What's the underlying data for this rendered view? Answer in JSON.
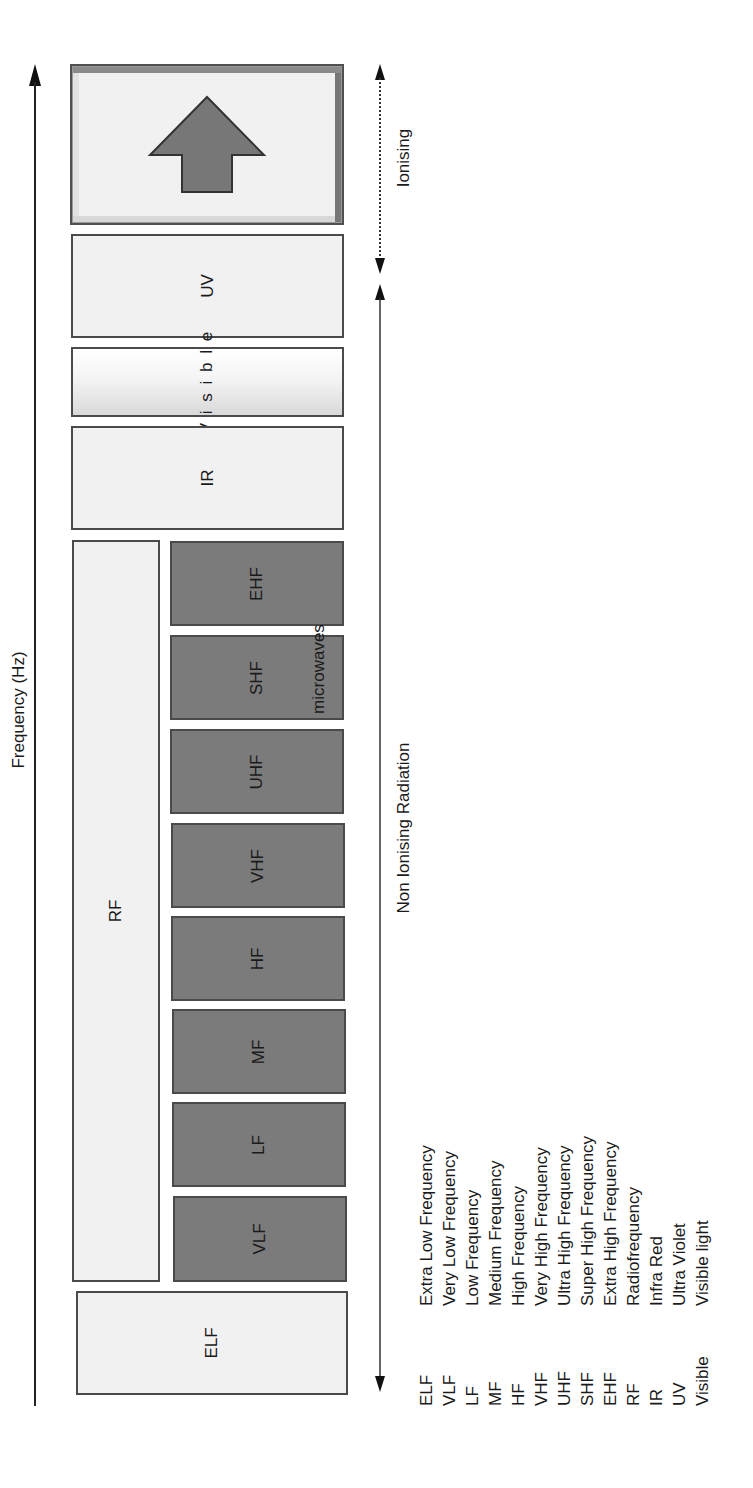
{
  "axis": {
    "frequency_label": "Frequency (Hz)"
  },
  "regions": {
    "ionising_label": "Ionising",
    "non_ionising_label": "Non Ionising Radiation"
  },
  "bands": {
    "ionising_icon": "up-arrow-icon",
    "uv": "UV",
    "visible": "V i s i b l e",
    "ir": "IR",
    "rf": "RF",
    "microwaves": "microwaves",
    "ehf": "EHF",
    "shf": "SHF",
    "uhf": "UHF",
    "vhf": "VHF",
    "hf": "HF",
    "mf": "MF",
    "lf": "LF",
    "vlf": "VLF",
    "elf": "ELF"
  },
  "legend": [
    {
      "abbr": "ELF",
      "full": "Extra Low Frequency"
    },
    {
      "abbr": "VLF",
      "full": "Very Low Frequency"
    },
    {
      "abbr": "LF",
      "full": "Low Frequency"
    },
    {
      "abbr": "MF",
      "full": "Medium Frequency"
    },
    {
      "abbr": "HF",
      "full": "High Frequency"
    },
    {
      "abbr": "VHF",
      "full": "Very High Frequency"
    },
    {
      "abbr": "UHF",
      "full": "Ultra High Frequency"
    },
    {
      "abbr": "SHF",
      "full": "Super High Frequency"
    },
    {
      "abbr": "EHF",
      "full": "Extra High Frequency"
    },
    {
      "abbr": "RF",
      "full": "Radiofrequency"
    },
    {
      "abbr": "IR",
      "full": "Infra Red"
    },
    {
      "abbr": "UV",
      "full": "Ultra Violet"
    },
    {
      "abbr": "Visible",
      "full": "Visible light"
    }
  ],
  "colors": {
    "dark_band": "#7b7b7b",
    "light_band": "#f1f1f1",
    "border": "#4a4a4a"
  }
}
